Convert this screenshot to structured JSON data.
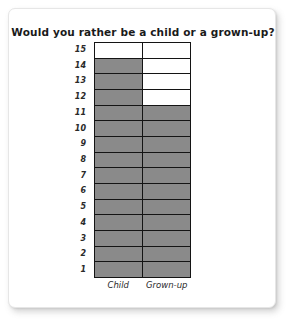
{
  "card": {
    "background_color": "#ffffff",
    "border_color": "#e6e6e6"
  },
  "chart_data": {
    "type": "bar",
    "title": "Would you rather be a child or a grown-up?",
    "xlabel": "",
    "ylabel": "",
    "categories": [
      "Child",
      "Grown-up"
    ],
    "values": [
      14,
      11
    ],
    "ylim": [
      0,
      15
    ],
    "y_ticks": [
      15,
      14,
      13,
      12,
      11,
      10,
      9,
      8,
      7,
      6,
      5,
      4,
      3,
      2,
      1
    ],
    "grid": true,
    "legend": "none",
    "orientation": "vertical",
    "style": "stacked-unit-squares",
    "filled_color": "#8a8a8a",
    "empty_color": "#ffffff",
    "border_color": "#141414",
    "series": [
      {
        "name": "Child",
        "value": 14
      },
      {
        "name": "Grown-up",
        "value": 11
      }
    ]
  }
}
